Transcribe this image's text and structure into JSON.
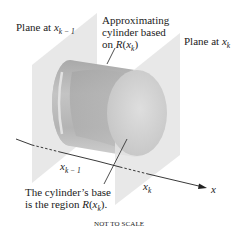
{
  "diagram": {
    "labels": {
      "plane_left": {
        "text": "Plane at ",
        "var": "x",
        "sub": "k − 1"
      },
      "plane_right": {
        "text": "Plane at ",
        "var": "x",
        "sub": "k"
      },
      "cylinder_line1": "Approximating",
      "cylinder_line2": "cylinder based",
      "cylinder_line3_prefix": "on ",
      "cylinder_line3_R": "R",
      "cylinder_line3_paren_open": "(",
      "cylinder_line3_var": "x",
      "cylinder_line3_sub": "k",
      "cylinder_line3_paren_close": ")",
      "axis_tick_left": {
        "var": "x",
        "sub": "k − 1"
      },
      "axis_tick_right": {
        "var": "x",
        "sub": "k"
      },
      "axis_label": "x",
      "base_line1": "The cylinder’s base",
      "base_line2_prefix": "is the region ",
      "base_line2_R": "R",
      "base_line2_var": "x",
      "base_line2_sub": "k",
      "base_line2_suffix": ").",
      "footer": "NOT TO SCALE"
    },
    "colors": {
      "plane": "#e6e6e6",
      "cylinder_side": "#b9b9b9",
      "cylinder_face": "#d0d0d0",
      "axis": "#222222"
    }
  }
}
